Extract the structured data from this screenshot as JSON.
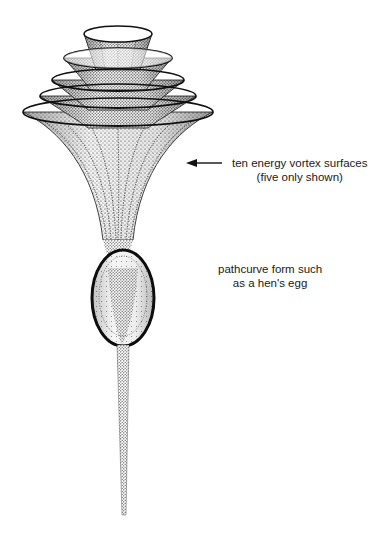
{
  "diagram": {
    "annotations": {
      "vortex": {
        "line1": "ten energy vortex surfaces",
        "line2": "(five only shown)"
      },
      "egg": {
        "line1": "pathcurve form such",
        "line2": "as a hen's egg"
      }
    },
    "elements": [
      {
        "id": "vortex-surfaces",
        "count_shown": 5,
        "count_total": 10
      },
      {
        "id": "egg-form"
      },
      {
        "id": "stem"
      },
      {
        "id": "pointer-arrow"
      }
    ],
    "colors": {
      "ink": "#1a1a1a",
      "stipple": "#2b2b2b",
      "background": "#ffffff"
    }
  }
}
